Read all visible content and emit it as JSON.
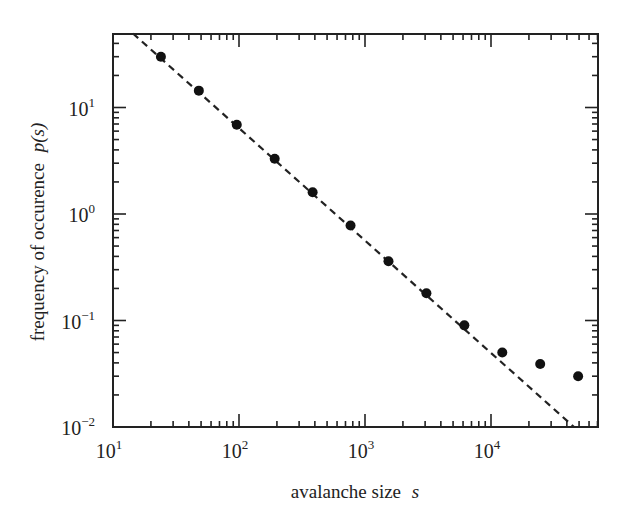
{
  "chart_data": {
    "type": "scatter",
    "title": "",
    "xlabel": "avalanche size",
    "xlabel_var": "s",
    "ylabel": "frequency of occurence",
    "ylabel_var": "p(s)",
    "xscale": "log",
    "yscale": "log",
    "xlim": [
      10,
      70000
    ],
    "ylim": [
      0.01,
      50
    ],
    "grid": false,
    "legend": null,
    "x_ticks": [
      {
        "value": 10,
        "base": "10",
        "exp": "1"
      },
      {
        "value": 100,
        "base": "10",
        "exp": "2"
      },
      {
        "value": 1000,
        "base": "10",
        "exp": "3"
      },
      {
        "value": 10000,
        "base": "10",
        "exp": "4"
      }
    ],
    "y_ticks": [
      {
        "value": 0.01,
        "base": "10",
        "exp": "−2"
      },
      {
        "value": 0.1,
        "base": "10",
        "exp": "−1"
      },
      {
        "value": 1,
        "base": "10",
        "exp": "0"
      },
      {
        "value": 10,
        "base": "10",
        "exp": "1"
      }
    ],
    "series": [
      {
        "name": "simulation data",
        "style": "filled-circle",
        "color": "#111111",
        "x": [
          24,
          48,
          96,
          192,
          384,
          768,
          1536,
          3072,
          6144,
          12288,
          24576,
          49152
        ],
        "y": [
          30,
          14.4,
          6.9,
          3.3,
          1.6,
          0.78,
          0.36,
          0.18,
          0.09,
          0.05,
          0.039,
          0.03
        ]
      },
      {
        "name": "power-law fit",
        "style": "dashed-line",
        "color": "#222222",
        "x": [
          14.4,
          45600
        ],
        "y": [
          49.5,
          0.01
        ],
        "slope": -1.06
      }
    ]
  }
}
